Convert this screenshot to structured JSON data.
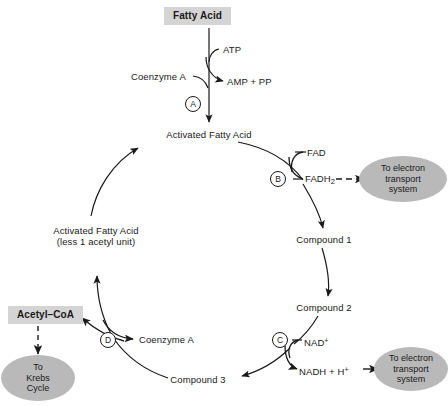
{
  "diagram": {
    "colors": {
      "box_fill": "#d4d4d4",
      "ellipse_fill": "#b9b9b9",
      "stroke": "#1a1a1a",
      "background": "#ffffff"
    }
  },
  "nodes": {
    "fatty_acid": "Fatty Acid",
    "activated_fatty_acid": "Activated Fatty Acid",
    "activated_fatty_acid_less_line1": "Activated Fatty Acid",
    "activated_fatty_acid_less_line2": "(less 1 acetyl unit)",
    "compound_1": "Compound 1",
    "compound_2": "Compound 2",
    "compound_3": "Compound 3",
    "acetyl_coa": "Acetyl–CoA"
  },
  "cofactors": {
    "atp": "ATP",
    "amp_pp": "AMP + PP",
    "coenzyme_a_top": "Coenzyme A",
    "coenzyme_a_bottom": "Coenzyme A",
    "fad": "FAD",
    "fadh2_main": "FADH",
    "fadh2_sub": "2",
    "nad_main": "NAD",
    "nad_sup": "+",
    "nadh_main": "NADH + H",
    "nadh_sup": "+"
  },
  "sinks": {
    "electron_transport_1": [
      "To electron",
      "transport",
      "system"
    ],
    "electron_transport_2": [
      "To electron",
      "transport",
      "system"
    ],
    "krebs": [
      "To",
      "Krebs",
      "Cycle"
    ]
  },
  "step_markers": [
    {
      "id": "A",
      "label": "A"
    },
    {
      "id": "B",
      "label": "B"
    },
    {
      "id": "C",
      "label": "C"
    },
    {
      "id": "D",
      "label": "D"
    }
  ]
}
